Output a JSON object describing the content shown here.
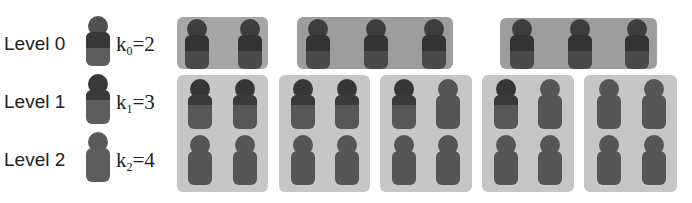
{
  "colors": {
    "level0": "#3c3c3c",
    "level1": "#4a4a4a",
    "level2": "#5c5c5c",
    "group_bg_level0": "#a3a3a3",
    "group_bg_level1": "#c4c4c4"
  },
  "legend": [
    {
      "label": "Level 0",
      "k_symbol": "k",
      "k_sub": "0",
      "k_value": "=2"
    },
    {
      "label": "Level 1",
      "k_symbol": "k",
      "k_sub": "1",
      "k_value": "=3"
    },
    {
      "label": "Level 2",
      "k_symbol": "k",
      "k_sub": "2",
      "k_value": "=4"
    }
  ],
  "hierarchy": {
    "level0_groups": [
      {
        "members": 2,
        "member_levels": [
          0,
          0
        ]
      },
      {
        "members": 3,
        "member_levels": [
          0,
          0,
          0
        ]
      },
      {
        "members": 3,
        "member_levels": [
          0,
          0,
          0
        ]
      }
    ],
    "level1_groups": [
      {
        "members": 4,
        "member_levels": [
          1,
          1,
          2,
          2
        ]
      },
      {
        "members": 4,
        "member_levels": [
          1,
          1,
          2,
          2
        ]
      },
      {
        "members": 4,
        "member_levels": [
          1,
          2,
          2,
          2
        ]
      },
      {
        "members": 4,
        "member_levels": [
          1,
          2,
          2,
          2
        ]
      },
      {
        "members": 4,
        "member_levels": [
          2,
          2,
          2,
          2
        ]
      }
    ]
  }
}
